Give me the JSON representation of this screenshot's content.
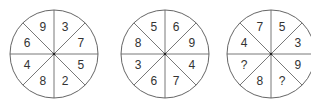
{
  "puzzle": {
    "circles": [
      {
        "label": "circle-1",
        "center": [
          54,
          54
        ],
        "radius": 44,
        "segments": [
          "3",
          "7",
          "5",
          "2",
          "8",
          "4",
          "6",
          "9"
        ]
      },
      {
        "label": "circle-2",
        "center": [
          165,
          54
        ],
        "radius": 44,
        "segments": [
          "6",
          "9",
          "4",
          "7",
          "6",
          "3",
          "8",
          "5"
        ]
      },
      {
        "label": "circle-3",
        "center": [
          271,
          54
        ],
        "radius": 44,
        "segments": [
          "5",
          "3",
          "9",
          "?",
          "8",
          "?",
          "4",
          "7"
        ]
      }
    ],
    "segment_order": "clockwise starting from top-right segment",
    "colors": {
      "line": "#555555",
      "text": "#333333",
      "background": "#ffffff"
    }
  }
}
